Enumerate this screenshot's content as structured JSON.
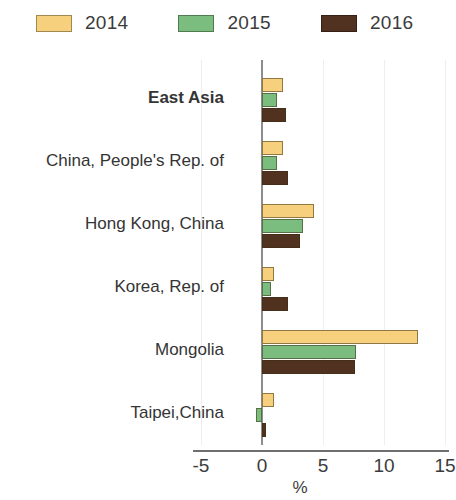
{
  "chart_data": {
    "type": "bar",
    "orientation": "horizontal",
    "title": "",
    "xlabel": "%",
    "ylabel": "",
    "xlim": [
      -5,
      15
    ],
    "xticks": [
      -5,
      0,
      5,
      10,
      15
    ],
    "xtick_labels": [
      "-5",
      "0",
      "5",
      "10",
      "15"
    ],
    "grid": true,
    "legend_position": "top-left",
    "categories": [
      "East Asia",
      "China, People's Rep. of",
      "Hong Kong, China",
      "Korea, Rep. of",
      "Mongolia",
      "Taipei,China"
    ],
    "series": [
      {
        "name": "2014",
        "color": "#f7d07e",
        "values": [
          1.7,
          1.7,
          4.3,
          1.0,
          12.8,
          1.0
        ]
      },
      {
        "name": "2015",
        "color": "#7bbd7e",
        "values": [
          1.2,
          1.2,
          3.4,
          0.7,
          7.7,
          -0.5
        ]
      },
      {
        "name": "2016",
        "color": "#513220",
        "values": [
          2.0,
          2.1,
          3.1,
          2.1,
          7.6,
          0.3
        ]
      }
    ]
  },
  "legend": {
    "items": [
      {
        "label": "2014",
        "color": "#f7d07e"
      },
      {
        "label": "2015",
        "color": "#7bbd7e"
      },
      {
        "label": "2016",
        "color": "#513220"
      }
    ]
  },
  "axis": {
    "unit_label": "%",
    "ticks": [
      "-5",
      "0",
      "5",
      "10",
      "15"
    ]
  },
  "categories": [
    {
      "label": "East Asia",
      "emphasis": true
    },
    {
      "label": "China, People's Rep. of",
      "emphasis": false
    },
    {
      "label": "Hong Kong, China",
      "emphasis": false
    },
    {
      "label": "Korea, Rep. of",
      "emphasis": false
    },
    {
      "label": "Mongolia",
      "emphasis": false
    },
    {
      "label": "Taipei,China",
      "emphasis": false
    }
  ]
}
